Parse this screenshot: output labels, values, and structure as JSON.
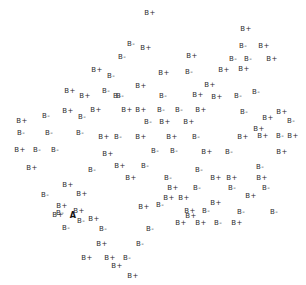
{
  "figure": {
    "background_color": "#ffffff",
    "label_color": "#2b2b2b",
    "highlight_color": "#111111",
    "width": 306,
    "height": 285
  },
  "chart_data": {
    "type": "scatter",
    "title": "",
    "subtitle": "",
    "xlabel": "",
    "ylabel": "",
    "grid": false,
    "legend": false,
    "axes_visible": false,
    "tick_labels_x": [],
    "tick_labels_y": [],
    "xlim": [
      0,
      306
    ],
    "ylim": [
      0,
      285
    ],
    "marker_style": "text-label",
    "classes": [
      "B+",
      "B-",
      "A"
    ],
    "annotations": [],
    "points": [
      {
        "label": "B+",
        "x": 150,
        "y": 13
      },
      {
        "label": "B-",
        "x": 131,
        "y": 44
      },
      {
        "label": "B+",
        "x": 146,
        "y": 48
      },
      {
        "label": "B-",
        "x": 122,
        "y": 57
      },
      {
        "label": "B+",
        "x": 246,
        "y": 29
      },
      {
        "label": "B-",
        "x": 243,
        "y": 46
      },
      {
        "label": "B+",
        "x": 192,
        "y": 56
      },
      {
        "label": "B+",
        "x": 264,
        "y": 46
      },
      {
        "label": "B-",
        "x": 189,
        "y": 72
      },
      {
        "label": "B+",
        "x": 97,
        "y": 70
      },
      {
        "label": "B-",
        "x": 111,
        "y": 76
      },
      {
        "label": "B+",
        "x": 70,
        "y": 91
      },
      {
        "label": "B-",
        "x": 106,
        "y": 91
      },
      {
        "label": "B+",
        "x": 85,
        "y": 96
      },
      {
        "label": "B-",
        "x": 120,
        "y": 96
      },
      {
        "label": "B+",
        "x": 141,
        "y": 86
      },
      {
        "label": "B+",
        "x": 210,
        "y": 85
      },
      {
        "label": "B-",
        "x": 233,
        "y": 59
      },
      {
        "label": "B-",
        "x": 248,
        "y": 59
      },
      {
        "label": "B+",
        "x": 272,
        "y": 59
      },
      {
        "label": "B+",
        "x": 244,
        "y": 69
      },
      {
        "label": "B-",
        "x": 46,
        "y": 116
      },
      {
        "label": "B+",
        "x": 68,
        "y": 111
      },
      {
        "label": "B-",
        "x": 82,
        "y": 117
      },
      {
        "label": "B+",
        "x": 96,
        "y": 110
      },
      {
        "label": "B-",
        "x": 117,
        "y": 96
      },
      {
        "label": "B+",
        "x": 127,
        "y": 110
      },
      {
        "label": "B+",
        "x": 141,
        "y": 110
      },
      {
        "label": "B-",
        "x": 161,
        "y": 110
      },
      {
        "label": "B-",
        "x": 179,
        "y": 110
      },
      {
        "label": "B+",
        "x": 201,
        "y": 110
      },
      {
        "label": "B+",
        "x": 217,
        "y": 97
      },
      {
        "label": "B-",
        "x": 238,
        "y": 96
      },
      {
        "label": "B+",
        "x": 198,
        "y": 95
      },
      {
        "label": "B-",
        "x": 256,
        "y": 92
      },
      {
        "label": "B+",
        "x": 22,
        "y": 121
      },
      {
        "label": "B-",
        "x": 148,
        "y": 122
      },
      {
        "label": "B+",
        "x": 165,
        "y": 122
      },
      {
        "label": "B+",
        "x": 189,
        "y": 122
      },
      {
        "label": "B-",
        "x": 244,
        "y": 112
      },
      {
        "label": "B+",
        "x": 268,
        "y": 118
      },
      {
        "label": "B+",
        "x": 282,
        "y": 112
      },
      {
        "label": "B-",
        "x": 291,
        "y": 121
      },
      {
        "label": "B+",
        "x": 259,
        "y": 129
      },
      {
        "label": "B-",
        "x": 21,
        "y": 133
      },
      {
        "label": "B-",
        "x": 49,
        "y": 133
      },
      {
        "label": "B-",
        "x": 80,
        "y": 133
      },
      {
        "label": "B+",
        "x": 104,
        "y": 137
      },
      {
        "label": "B-",
        "x": 118,
        "y": 137
      },
      {
        "label": "B+",
        "x": 141,
        "y": 137
      },
      {
        "label": "B+",
        "x": 172,
        "y": 137
      },
      {
        "label": "B-",
        "x": 196,
        "y": 137
      },
      {
        "label": "B+",
        "x": 243,
        "y": 137
      },
      {
        "label": "B+",
        "x": 263,
        "y": 136
      },
      {
        "label": "B-",
        "x": 280,
        "y": 136
      },
      {
        "label": "B+",
        "x": 293,
        "y": 136
      },
      {
        "label": "B+",
        "x": 20,
        "y": 150
      },
      {
        "label": "B-",
        "x": 37,
        "y": 150
      },
      {
        "label": "B-",
        "x": 55,
        "y": 150
      },
      {
        "label": "B+",
        "x": 108,
        "y": 154
      },
      {
        "label": "B-",
        "x": 155,
        "y": 151
      },
      {
        "label": "B-",
        "x": 174,
        "y": 151
      },
      {
        "label": "B+",
        "x": 207,
        "y": 152
      },
      {
        "label": "B+",
        "x": 282,
        "y": 152
      },
      {
        "label": "B+",
        "x": 32,
        "y": 168
      },
      {
        "label": "B-",
        "x": 199,
        "y": 170
      },
      {
        "label": "B-",
        "x": 260,
        "y": 167
      },
      {
        "label": "B+",
        "x": 216,
        "y": 178
      },
      {
        "label": "B+",
        "x": 232,
        "y": 178
      },
      {
        "label": "B-",
        "x": 232,
        "y": 188
      },
      {
        "label": "B+",
        "x": 262,
        "y": 178
      },
      {
        "label": "B-",
        "x": 266,
        "y": 188
      },
      {
        "label": "B+",
        "x": 68,
        "y": 185
      },
      {
        "label": "B+",
        "x": 82,
        "y": 194
      },
      {
        "label": "B+",
        "x": 251,
        "y": 196
      },
      {
        "label": "B-",
        "x": 45,
        "y": 195
      },
      {
        "label": "B+",
        "x": 62,
        "y": 206
      },
      {
        "label": "B-",
        "x": 60,
        "y": 213
      },
      {
        "label": "B-",
        "x": 197,
        "y": 188
      },
      {
        "label": "B+",
        "x": 173,
        "y": 188
      },
      {
        "label": "A",
        "x": 73,
        "y": 215
      },
      {
        "label": "B+",
        "x": 79,
        "y": 211
      },
      {
        "label": "B-",
        "x": 81,
        "y": 221
      },
      {
        "label": "B+",
        "x": 94,
        "y": 219
      },
      {
        "label": "B+",
        "x": 169,
        "y": 198
      },
      {
        "label": "B+",
        "x": 184,
        "y": 198
      },
      {
        "label": "B-",
        "x": 160,
        "y": 205
      },
      {
        "label": "B+",
        "x": 144,
        "y": 207
      },
      {
        "label": "B+",
        "x": 190,
        "y": 211
      },
      {
        "label": "B-",
        "x": 206,
        "y": 211
      },
      {
        "label": "B+",
        "x": 216,
        "y": 203
      },
      {
        "label": "B-",
        "x": 241,
        "y": 212
      },
      {
        "label": "B-",
        "x": 274,
        "y": 212
      },
      {
        "label": "B-",
        "x": 150,
        "y": 229
      },
      {
        "label": "B+",
        "x": 58,
        "y": 215
      },
      {
        "label": "B-",
        "x": 66,
        "y": 228
      },
      {
        "label": "B+",
        "x": 191,
        "y": 216
      },
      {
        "label": "B+",
        "x": 181,
        "y": 223
      },
      {
        "label": "B+",
        "x": 201,
        "y": 223
      },
      {
        "label": "B-",
        "x": 218,
        "y": 223
      },
      {
        "label": "B+",
        "x": 237,
        "y": 223
      },
      {
        "label": "B-",
        "x": 103,
        "y": 229
      },
      {
        "label": "B+",
        "x": 102,
        "y": 244
      },
      {
        "label": "B-",
        "x": 140,
        "y": 244
      },
      {
        "label": "B+",
        "x": 87,
        "y": 258
      },
      {
        "label": "B+",
        "x": 110,
        "y": 258
      },
      {
        "label": "B-",
        "x": 127,
        "y": 258
      },
      {
        "label": "B+",
        "x": 117,
        "y": 266
      },
      {
        "label": "B+",
        "x": 133,
        "y": 276
      },
      {
        "label": "B-",
        "x": 168,
        "y": 178
      },
      {
        "label": "B+",
        "x": 131,
        "y": 178
      },
      {
        "label": "B-",
        "x": 145,
        "y": 166
      },
      {
        "label": "B+",
        "x": 120,
        "y": 166
      },
      {
        "label": "B-",
        "x": 92,
        "y": 170
      },
      {
        "label": "B-",
        "x": 229,
        "y": 152
      },
      {
        "label": "B+",
        "x": 224,
        "y": 70
      },
      {
        "label": "B-",
        "x": 163,
        "y": 96
      },
      {
        "label": "B+",
        "x": 164,
        "y": 73
      }
    ]
  }
}
